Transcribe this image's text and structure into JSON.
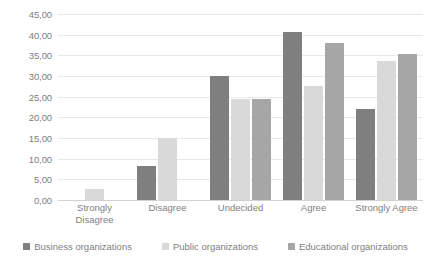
{
  "chart_data": {
    "type": "bar",
    "title": "",
    "xlabel": "",
    "ylabel": "",
    "ylim": [
      0,
      45
    ],
    "ytick_step": 5,
    "grid": true,
    "legend_position": "bottom",
    "categories": [
      "Strongly Disagree",
      "Disagree",
      "Undecided",
      "Agree",
      "Strongly Agree"
    ],
    "ytick_labels": [
      "45,00",
      "40,00",
      "35,00",
      "30,00",
      "25,00",
      "20,00",
      "15,00",
      "10,00",
      "5,00",
      "0,00"
    ],
    "ytick_values": [
      45,
      40,
      35,
      30,
      25,
      20,
      15,
      10,
      5,
      0
    ],
    "series": [
      {
        "name": "Business organizations",
        "color": "#7f7f7f",
        "values": [
          0,
          8.3,
          30.0,
          40.7,
          22.0
        ]
      },
      {
        "name": "Public organizations",
        "color": "#d9d9d9",
        "values": [
          2.7,
          15.1,
          24.4,
          27.6,
          33.7
        ]
      },
      {
        "name": "Educational organizations",
        "color": "#a6a6a6",
        "values": [
          0,
          0,
          24.5,
          38.0,
          35.4
        ]
      }
    ]
  }
}
